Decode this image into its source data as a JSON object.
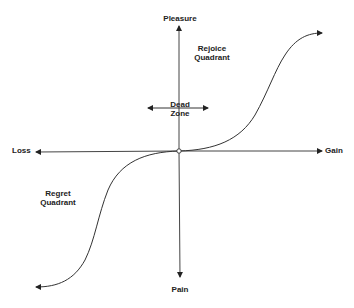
{
  "diagram": {
    "axes": {
      "x_positive": "Gain",
      "x_negative": "Loss",
      "y_positive": "Pleasure",
      "y_negative": "Pain"
    },
    "regions": {
      "rejoice": {
        "line1": "Rejoice",
        "line2": "Quadrant"
      },
      "regret": {
        "line1": "Regret",
        "line2": "Quadrant"
      },
      "dead_zone": {
        "line1": "Dead",
        "line2": "Zone"
      }
    },
    "colors": {
      "line": "#333333",
      "text": "#222222",
      "background": "#ffffff"
    }
  }
}
